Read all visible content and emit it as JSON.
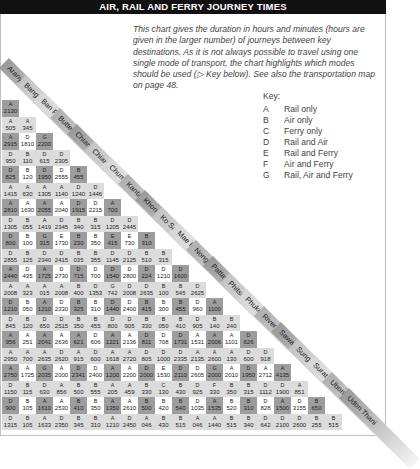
{
  "title": "AIR, RAIL AND FERRY JOURNEY TIMES",
  "intro": "This chart gives the duration in hours and minutes (hours are given in the larger number) of journeys between key destinations. As it is not always possible to travel using one single mode of transport, the chart highlights which modes should be used (▷ Key below). See also the transportation map on page 48.",
  "key": {
    "title": "Key:",
    "items": [
      {
        "letter": "A",
        "label": "Rail only"
      },
      {
        "letter": "B",
        "label": "Air only"
      },
      {
        "letter": "C",
        "label": "Ferry only"
      },
      {
        "letter": "D",
        "label": "Rail and Air"
      },
      {
        "letter": "E",
        "label": "Rail and Ferry"
      },
      {
        "letter": "F",
        "label": "Air and Ferry"
      },
      {
        "letter": "G",
        "label": "Rail, Air and Ferry"
      }
    ]
  },
  "towns": [
    "Aranyaprathet",
    "Bangkok",
    "Ban Phu Ta Luang",
    "Butterworth",
    "Chiang Mai",
    "Chiang Rai",
    "Chumphon",
    "Kantang",
    "Khon Kaen",
    "Ko Samui",
    "Mae Hong Son",
    "Nong Khai",
    "Pattaya",
    "Phitsanulok",
    "Phuket",
    "River Kwai Bridge",
    "Sawankhalok",
    "Sungai Kolok",
    "Surat Thani",
    "Ubon Ratchathani",
    "Udon Thani"
  ],
  "chart_data": {
    "type": "table",
    "title": "Air, Rail and Ferry Journey Times",
    "rows": [
      {
        "town": "Bangkok",
        "cells": [
          [
            "A",
            "2130"
          ]
        ]
      },
      {
        "town": "Ban Phu Ta Luang",
        "cells": [
          [
            "A",
            "505"
          ],
          [
            "A",
            "345"
          ]
        ]
      },
      {
        "town": "Butterworth",
        "cells": [
          [
            "A",
            "2915"
          ],
          [
            "D",
            "1810"
          ],
          [
            "G",
            "2200"
          ]
        ]
      },
      {
        "town": "Chiang Mai",
        "cells": [
          [
            "D",
            "950"
          ],
          [
            "B",
            "110"
          ],
          [
            "D",
            "615"
          ],
          [
            "D",
            "2305"
          ]
        ]
      },
      {
        "town": "Chiang Rai",
        "cells": [
          [
            "D",
            "825"
          ],
          [
            "B",
            "120"
          ],
          [
            "D",
            "1950"
          ],
          [
            "D",
            "2555"
          ],
          [
            "B",
            "455"
          ]
        ]
      },
      {
        "town": "Chumphon",
        "cells": [
          [
            "A",
            "1415"
          ],
          [
            "A",
            "630"
          ],
          [
            "A",
            "1305"
          ],
          [
            "A",
            "1140"
          ],
          [
            "D",
            "1240"
          ],
          [
            "D",
            "1446"
          ]
        ]
      },
      {
        "town": "Kantang",
        "cells": [
          [
            "A",
            "2810"
          ],
          [
            "A",
            "1630"
          ],
          [
            "A",
            "2055"
          ],
          [
            "A",
            "2040"
          ],
          [
            "D",
            "1915"
          ],
          [
            "D",
            "2215"
          ],
          [
            "A",
            "700"
          ]
        ]
      },
      {
        "town": "Khon Kaen",
        "cells": [
          [
            "D",
            "1305"
          ],
          [
            "B",
            "055"
          ],
          [
            "A",
            "1419"
          ],
          [
            "D",
            "2345"
          ],
          [
            "B",
            "340"
          ],
          [
            "B",
            "315"
          ],
          [
            "D",
            "1205"
          ],
          [
            "D",
            "2445"
          ]
        ]
      },
      {
        "town": "Ko Samui",
        "cells": [
          [
            "D",
            "800"
          ],
          [
            "B",
            "100"
          ],
          [
            "G",
            "315"
          ],
          [
            "E",
            "1730"
          ],
          [
            "B",
            "230"
          ],
          [
            "B",
            "350"
          ],
          [
            "E",
            "415"
          ],
          [
            "E",
            "730"
          ],
          [
            "B",
            "310"
          ]
        ]
      },
      {
        "town": "Mae Hong Son",
        "cells": [
          [
            "D",
            "2855"
          ],
          [
            "B",
            "125"
          ],
          [
            "D",
            "2340"
          ],
          [
            "D",
            "2415"
          ],
          [
            "B",
            "035"
          ],
          [
            "B",
            "355"
          ],
          [
            "D",
            "1145"
          ],
          [
            "D",
            "2125"
          ],
          [
            "B",
            "510"
          ],
          [
            "B",
            "315"
          ]
        ]
      },
      {
        "town": "Nong Khai",
        "cells": [
          [
            "A",
            "2440"
          ],
          [
            "D",
            "435"
          ],
          [
            "A",
            "1725"
          ],
          [
            "D",
            "2730"
          ],
          [
            "D",
            "715"
          ],
          [
            "D",
            "700"
          ],
          [
            "D",
            "1540"
          ],
          [
            "D",
            "2800"
          ],
          [
            "D",
            "224"
          ],
          [
            "D",
            "1210"
          ],
          [
            "D",
            "1600"
          ]
        ]
      },
      {
        "town": "Pattaya",
        "cells": [
          [
            "A",
            "2008"
          ],
          [
            "A",
            "323"
          ],
          [
            "A",
            "015"
          ],
          [
            "A",
            "2008"
          ],
          [
            "B",
            "400"
          ],
          [
            "D",
            "1353"
          ],
          [
            "G",
            "742"
          ],
          [
            "D",
            "2008"
          ],
          [
            "D",
            "2635"
          ],
          [
            "B",
            "100"
          ],
          [
            "B",
            "545"
          ],
          [
            "D",
            "2625"
          ]
        ]
      },
      {
        "town": "Phitsanulok",
        "cells": [
          [
            "D",
            "1210"
          ],
          [
            "B",
            "050"
          ],
          [
            "A",
            "1210"
          ],
          [
            "D",
            "2330"
          ],
          [
            "B",
            "325"
          ],
          [
            "B",
            "310"
          ],
          [
            "D",
            "1440"
          ],
          [
            "D",
            "2400"
          ],
          [
            "B",
            "415"
          ],
          [
            "B",
            "300"
          ],
          [
            "B",
            "455"
          ],
          [
            "D",
            "960"
          ],
          [
            "A",
            "1100"
          ]
        ]
      },
      {
        "town": "Phuket",
        "cells": [
          [
            "D",
            "845"
          ],
          [
            "B",
            "120"
          ],
          [
            "D",
            "650"
          ],
          [
            "D",
            "2515"
          ],
          [
            "B",
            "350"
          ],
          [
            "B",
            "455"
          ],
          [
            "D",
            "800"
          ],
          [
            "D",
            "905"
          ],
          [
            "B",
            "330"
          ],
          [
            "B",
            "050"
          ],
          [
            "B",
            "410"
          ],
          [
            "D",
            "905"
          ],
          [
            "B",
            "140"
          ],
          [
            "B",
            "240"
          ]
        ]
      },
      {
        "town": "River Kwai Bridge",
        "cells": [
          [
            "A",
            "956"
          ],
          [
            "A",
            "251"
          ],
          [
            "A",
            "2041"
          ],
          [
            "A",
            "2636"
          ],
          [
            "A",
            "621"
          ],
          [
            "D",
            "606"
          ],
          [
            "A",
            "1221"
          ],
          [
            "A",
            "2136"
          ],
          [
            "D",
            "811"
          ],
          [
            "D",
            "708"
          ],
          [
            "D",
            "1731"
          ],
          [
            "A",
            "1531"
          ],
          [
            "A",
            "2006"
          ],
          [
            "A",
            "1101"
          ],
          [
            "D",
            "626"
          ]
        ]
      },
      {
        "town": "Sawankhalok",
        "cells": [
          [
            "A",
            "2950"
          ],
          [
            "A",
            "700"
          ],
          [
            "A",
            "2635"
          ],
          [
            "D",
            "2620"
          ],
          [
            "A",
            "915"
          ],
          [
            "D",
            "600"
          ],
          [
            "A",
            "1618"
          ],
          [
            "A",
            "2720"
          ],
          [
            "D",
            "805"
          ],
          [
            "D",
            "1000"
          ],
          [
            "D",
            "2335"
          ],
          [
            "A",
            "2135"
          ],
          [
            "A",
            "2600"
          ],
          [
            "A",
            "130"
          ],
          [
            "D",
            "600"
          ],
          [
            "D",
            "918"
          ]
        ]
      },
      {
        "town": "Sungai Kolok",
        "cells": [
          [
            "A",
            "2750"
          ],
          [
            "A",
            "1725"
          ],
          [
            "G",
            "2035"
          ],
          [
            "A",
            "2000"
          ],
          [
            "D",
            "2341"
          ],
          [
            "D",
            "2400"
          ],
          [
            "A",
            "1200"
          ],
          [
            "A",
            "2200"
          ],
          [
            "D",
            "2000"
          ],
          [
            "E",
            "1530"
          ],
          [
            "D",
            "2110"
          ],
          [
            "D",
            "2605"
          ],
          [
            "G",
            "2000"
          ],
          [
            "A",
            "2010"
          ],
          [
            "D",
            "1950"
          ],
          [
            "A",
            "2712"
          ],
          [
            "A",
            "4135"
          ]
        ]
      },
      {
        "town": "Surat Thani",
        "cells": [
          [
            "D",
            "1150"
          ],
          [
            "B",
            "115"
          ],
          [
            "D",
            "630"
          ],
          [
            "A",
            "856"
          ],
          [
            "B",
            "500"
          ],
          [
            "B",
            "555"
          ],
          [
            "A",
            "205"
          ],
          [
            "A",
            "459"
          ],
          [
            "B",
            "330"
          ],
          [
            "C",
            "130"
          ],
          [
            "B",
            "430"
          ],
          [
            "D",
            "925"
          ],
          [
            "F",
            "330"
          ],
          [
            "B",
            "350"
          ],
          [
            "B",
            "315"
          ],
          [
            "D",
            "1112"
          ],
          [
            "D",
            "1900"
          ],
          [
            "A",
            "851"
          ]
        ]
      },
      {
        "town": "Ubon Ratchathani",
        "cells": [
          [
            "D",
            "900"
          ],
          [
            "B",
            "105"
          ],
          [
            "A",
            "1610"
          ],
          [
            "A",
            "2530"
          ],
          [
            "B",
            "410"
          ],
          [
            "B",
            "350"
          ],
          [
            "A",
            "1350"
          ],
          [
            "A",
            "2610"
          ],
          [
            "B",
            "500"
          ],
          [
            "B",
            "420"
          ],
          [
            "B",
            "540"
          ],
          [
            "D",
            "1035"
          ],
          [
            "A",
            "1535"
          ],
          [
            "B",
            "520"
          ],
          [
            "B",
            "310"
          ],
          [
            "D",
            "828"
          ],
          [
            "A",
            "1500"
          ],
          [
            "D",
            "3155"
          ],
          [
            "B",
            "650"
          ]
        ]
      },
      {
        "town": "Udon Thani",
        "cells": [
          [
            "D",
            "1315"
          ],
          [
            "B",
            "105"
          ],
          [
            "A",
            "1633"
          ],
          [
            "D",
            "2350"
          ],
          [
            "B",
            "345"
          ],
          [
            "B",
            "310"
          ],
          [
            "A",
            "1210"
          ],
          [
            "D",
            "2450"
          ],
          [
            "A",
            "046"
          ],
          [
            "B",
            "430"
          ],
          [
            "B",
            "515"
          ],
          [
            "A",
            "046"
          ],
          [
            "A",
            "1440"
          ],
          [
            "B",
            "515"
          ],
          [
            "B",
            "340"
          ],
          [
            "D",
            "642"
          ],
          [
            "D",
            "2100"
          ],
          [
            "D",
            "2600"
          ],
          [
            "B",
            "255"
          ],
          [
            "B",
            "515"
          ]
        ]
      }
    ]
  }
}
